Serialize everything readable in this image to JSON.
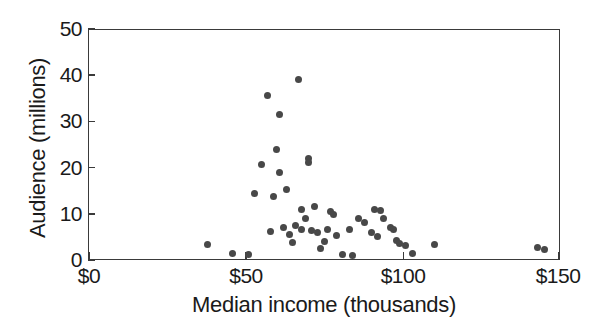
{
  "chart_data": {
    "type": "scatter",
    "title": "",
    "xlabel": "Median income (thousands)",
    "ylabel": "Audience (millions)",
    "xlim": [
      0,
      150
    ],
    "ylim": [
      0,
      50
    ],
    "grid": false,
    "legend": "none",
    "x_tick_labels": [
      "$0",
      "$50",
      "$100",
      "$150"
    ],
    "x_tick_values": [
      0,
      50,
      100,
      150
    ],
    "y_tick_labels": [
      "0",
      "10",
      "20",
      "30",
      "40",
      "50"
    ],
    "y_tick_values": [
      0,
      10,
      20,
      30,
      40,
      50
    ],
    "marker_color": "#484848",
    "marker_shape": "circle",
    "series": [
      {
        "name": "stations",
        "points": [
          [
            38,
            3.3
          ],
          [
            46,
            1.3
          ],
          [
            51,
            1.2
          ],
          [
            53,
            14.5
          ],
          [
            55,
            20.6
          ],
          [
            57,
            35.6
          ],
          [
            58,
            6.2
          ],
          [
            59,
            13.8
          ],
          [
            60,
            24.0
          ],
          [
            61,
            19.0
          ],
          [
            61,
            31.5
          ],
          [
            62,
            7.0
          ],
          [
            63,
            15.2
          ],
          [
            64,
            5.5
          ],
          [
            65,
            3.8
          ],
          [
            66,
            7.5
          ],
          [
            67,
            39.0
          ],
          [
            68,
            11.0
          ],
          [
            68,
            6.5
          ],
          [
            69,
            9.0
          ],
          [
            70,
            22.0
          ],
          [
            70,
            21.0
          ],
          [
            71,
            6.3
          ],
          [
            72,
            11.5
          ],
          [
            73,
            6.0
          ],
          [
            74,
            2.5
          ],
          [
            75,
            4.0
          ],
          [
            76,
            6.5
          ],
          [
            77,
            10.5
          ],
          [
            78,
            9.8
          ],
          [
            79,
            5.2
          ],
          [
            81,
            1.2
          ],
          [
            83,
            6.5
          ],
          [
            84,
            0.9
          ],
          [
            86,
            9.0
          ],
          [
            88,
            8.2
          ],
          [
            90,
            6.0
          ],
          [
            91,
            11.0
          ],
          [
            92,
            5.0
          ],
          [
            93,
            10.8
          ],
          [
            94,
            9.0
          ],
          [
            96,
            7.0
          ],
          [
            97,
            6.5
          ],
          [
            98,
            4.2
          ],
          [
            99,
            3.5
          ],
          [
            101,
            3.2
          ],
          [
            103,
            1.3
          ],
          [
            110,
            3.3
          ],
          [
            143,
            2.8
          ],
          [
            145,
            2.2
          ]
        ]
      }
    ]
  },
  "axes": {
    "x_title": "Median income (thousands)",
    "y_title": "Audience (millions)"
  }
}
